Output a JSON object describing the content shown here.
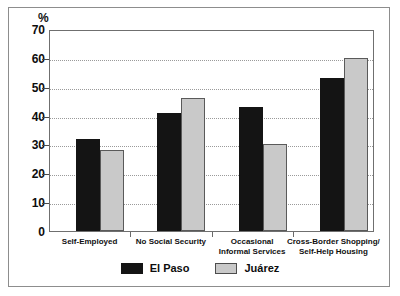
{
  "chart_data": {
    "type": "bar",
    "title": "",
    "subtitle": "",
    "xlabel": "",
    "ylabel": "%",
    "ylim": [
      0,
      70
    ],
    "ytick_step": 10,
    "yticks": [
      "70",
      "60",
      "50",
      "40",
      "30",
      "20",
      "10",
      "0"
    ],
    "ytick_values": [
      70,
      60,
      50,
      40,
      30,
      20,
      10,
      0
    ],
    "grid": true,
    "grid_style": "dotted-horizontal",
    "legend_position": "bottom-center",
    "categories": [
      "Self-Employed",
      "No Social Security",
      "Occasional Informal Services",
      "Cross-Border Shopping/ Self-Help Housing"
    ],
    "category_lines": [
      [
        "Self-Employed"
      ],
      [
        "No Social Security"
      ],
      [
        "Occasional",
        "Informal Services"
      ],
      [
        "Cross-Border Shopping/",
        "Self-Help Housing"
      ]
    ],
    "series": [
      {
        "name": "El Paso",
        "color": "#141414",
        "values": [
          32,
          41,
          43,
          53
        ]
      },
      {
        "name": "Juárez",
        "color": "#c9c9c9",
        "values": [
          28,
          46,
          30,
          60
        ]
      }
    ]
  },
  "axis": {
    "percent_symbol": "%"
  },
  "legend": {
    "items": [
      {
        "label": "El Paso",
        "swatch": "black-swatch"
      },
      {
        "label": "Juárez",
        "swatch": "gray-swatch"
      }
    ]
  }
}
